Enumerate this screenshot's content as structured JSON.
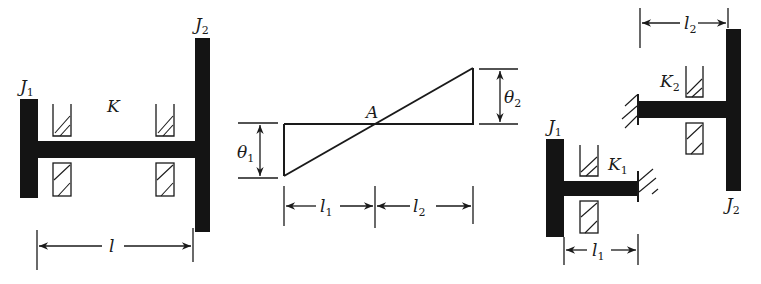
{
  "figures": [
    {
      "id": "fig1",
      "description": "Two-disk torsional system on a shaft supported by two bearings",
      "labels": {
        "J1": "J",
        "J1_sub": "1",
        "J2": "J",
        "J2_sub": "2",
        "K": "K",
        "l": "l"
      }
    },
    {
      "id": "fig2",
      "description": "Mode shape of angular displacement with node A",
      "labels": {
        "A": "A",
        "theta1": "θ",
        "theta1_sub": "1",
        "theta2": "θ",
        "theta2_sub": "2",
        "l1": "l",
        "l1_sub": "1",
        "l2": "l",
        "l2_sub": "2"
      }
    },
    {
      "id": "fig3",
      "description": "Equivalent system: two single-disk cantilevered shafts fixed at node",
      "labels": {
        "J1": "J",
        "J1_sub": "1",
        "J2": "J",
        "J2_sub": "2",
        "K1": "K",
        "K1_sub": "1",
        "K2": "K",
        "K2_sub": "2",
        "l1": "l",
        "l1_sub": "1",
        "l2": "l",
        "l2_sub": "2"
      }
    }
  ],
  "colors": {
    "ink": "#141414",
    "background": "#ffffff"
  }
}
